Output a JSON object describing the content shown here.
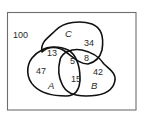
{
  "diagram": {
    "type": "venn",
    "universe_count": "100",
    "sets": [
      {
        "name": "A",
        "only": "47"
      },
      {
        "name": "B",
        "only": "42"
      },
      {
        "name": "C",
        "only": "34"
      }
    ],
    "regions": {
      "outside": "100",
      "A_only": "47",
      "B_only": "42",
      "C_only": "34",
      "A_and_C_only": "13",
      "B_and_C_only": "8",
      "A_and_B_only": "15",
      "A_and_B_and_C": "5"
    },
    "labels": {
      "a": "A",
      "b": "B",
      "c": "C"
    },
    "colors": {
      "frame": "#6e6e6e",
      "outline": "#111111",
      "text": "#2a2a2a",
      "background": "#ffffff"
    }
  }
}
